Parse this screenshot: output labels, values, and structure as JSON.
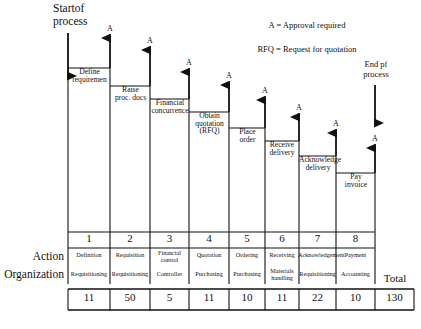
{
  "diagram": {
    "start_label": "Startof\nprocess",
    "end_label": "End pf\nprocess",
    "legend": [
      "A = Approval\nrequired",
      "RFQ = Request for\nquotation"
    ],
    "approval_mark": "A",
    "steps": [
      {
        "n": 1,
        "label": "Define\nrequiremen"
      },
      {
        "n": 2,
        "label": "Raise\nproc. docs"
      },
      {
        "n": 3,
        "label": "Financial\nconcurrence"
      },
      {
        "n": 4,
        "label": "Obtain\nquotation\n(RFQ)"
      },
      {
        "n": 5,
        "label": "Place\norder"
      },
      {
        "n": 6,
        "label": "Receive\ndelivery"
      },
      {
        "n": 7,
        "label": "Acknowledge\ndelivery"
      },
      {
        "n": 8,
        "label": "Pay\ninvoice"
      }
    ]
  },
  "table": {
    "row_labels": {
      "action": "Action",
      "organization": "Organization",
      "total": "Total"
    },
    "numbers": [
      "1",
      "2",
      "3",
      "4",
      "5",
      "6",
      "7",
      "8"
    ],
    "actions": [
      "Definition",
      "Requisition",
      "Financial\ncontrol",
      "Quotation",
      "Ordering",
      "Receiving",
      "Acknowledgement",
      "Payment"
    ],
    "organizations": [
      "Requisitioning",
      "Requisitioning",
      "Controller",
      "Purchasing",
      "Purchasing",
      "Materials\nhandling",
      "Requisitioning",
      "Accounting"
    ],
    "days": [
      "11",
      "50",
      "5",
      "11",
      "10",
      "11",
      "22",
      "10"
    ],
    "total_value": "130"
  },
  "colors": {
    "ink": "#111111",
    "line": "#1a1a1a",
    "paper": "#ffffff"
  }
}
